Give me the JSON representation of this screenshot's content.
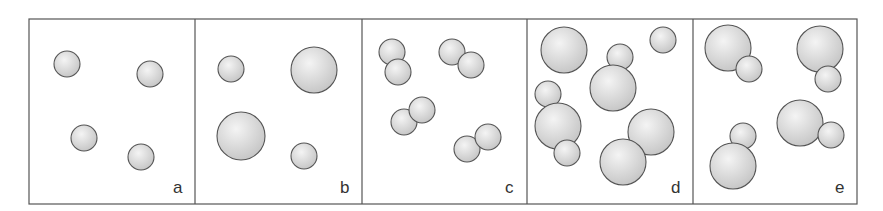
{
  "figure": {
    "frame": {
      "x": 29,
      "y": 19,
      "width": 828,
      "height": 185
    },
    "colors": {
      "border": "#555555",
      "circle_stroke": "#555555",
      "circle_fill_light": "#f2f2f2",
      "circle_fill_dark": "#c8c8c8",
      "label": "#333333"
    },
    "panels": [
      {
        "label": "a",
        "x": 29,
        "width": 166,
        "circles": [
          {
            "cx": 67,
            "cy": 64,
            "r": 13
          },
          {
            "cx": 150,
            "cy": 74,
            "r": 13
          },
          {
            "cx": 84,
            "cy": 138,
            "r": 13
          },
          {
            "cx": 141,
            "cy": 157,
            "r": 13
          }
        ]
      },
      {
        "label": "b",
        "x": 195,
        "width": 167,
        "circles": [
          {
            "cx": 231,
            "cy": 69,
            "r": 13
          },
          {
            "cx": 314,
            "cy": 70,
            "r": 23
          },
          {
            "cx": 241,
            "cy": 136,
            "r": 24
          },
          {
            "cx": 304,
            "cy": 156,
            "r": 13
          }
        ]
      },
      {
        "label": "c",
        "x": 362,
        "width": 165,
        "circles": [
          {
            "cx": 392,
            "cy": 52,
            "r": 13
          },
          {
            "cx": 398,
            "cy": 72,
            "r": 13
          },
          {
            "cx": 452,
            "cy": 52,
            "r": 13
          },
          {
            "cx": 471,
            "cy": 65,
            "r": 13
          },
          {
            "cx": 404,
            "cy": 122,
            "r": 13
          },
          {
            "cx": 422,
            "cy": 110,
            "r": 13
          },
          {
            "cx": 467,
            "cy": 149,
            "r": 13
          },
          {
            "cx": 488,
            "cy": 137,
            "r": 13
          }
        ]
      },
      {
        "label": "d",
        "x": 527,
        "width": 166,
        "circles": [
          {
            "cx": 564,
            "cy": 50,
            "r": 23
          },
          {
            "cx": 620,
            "cy": 57,
            "r": 13
          },
          {
            "cx": 663,
            "cy": 40,
            "r": 13
          },
          {
            "cx": 613,
            "cy": 88,
            "r": 23
          },
          {
            "cx": 548,
            "cy": 94,
            "r": 13
          },
          {
            "cx": 558,
            "cy": 126,
            "r": 23
          },
          {
            "cx": 567,
            "cy": 153,
            "r": 13
          },
          {
            "cx": 651,
            "cy": 132,
            "r": 23
          },
          {
            "cx": 623,
            "cy": 162,
            "r": 23
          }
        ]
      },
      {
        "label": "e",
        "x": 693,
        "width": 164,
        "circles": [
          {
            "cx": 728,
            "cy": 48,
            "r": 23
          },
          {
            "cx": 749,
            "cy": 69,
            "r": 13
          },
          {
            "cx": 820,
            "cy": 49,
            "r": 23
          },
          {
            "cx": 828,
            "cy": 79,
            "r": 13
          },
          {
            "cx": 800,
            "cy": 123,
            "r": 23
          },
          {
            "cx": 831,
            "cy": 135,
            "r": 13
          },
          {
            "cx": 743,
            "cy": 136,
            "r": 13
          },
          {
            "cx": 733,
            "cy": 166,
            "r": 23
          }
        ]
      }
    ]
  }
}
